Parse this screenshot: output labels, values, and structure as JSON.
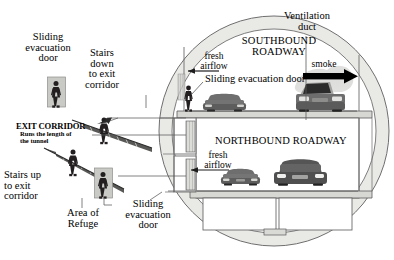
{
  "diagram": {
    "colors": {
      "ring_fill": "#e9e9e6",
      "ring_stroke": "#6f6f6f",
      "roadway_fill": "#ffffff",
      "deck_fill": "#d7d7d4",
      "door_fill": "#c9c9c6",
      "person_fill": "#231f20",
      "car_dark": "#5d5d5d",
      "car_mid": "#6e6e6e",
      "smoke_arrow": "#000000",
      "leader_line": "#5a5a5a"
    }
  },
  "labels": {
    "sliding_evacuation_door_top": "Sliding\nevacuation\ndoor",
    "sliding_evacuation_door_top_l1": "Sliding",
    "sliding_evacuation_door_top_l2": "evacuation",
    "sliding_evacuation_door_top_l3": "door",
    "stairs_down_l1": "Stairs",
    "stairs_down_l2": "down",
    "stairs_down_l3": "to exit",
    "stairs_down_l4": "corridor",
    "exit_corridor_title": "EXIT CORRIDOR",
    "exit_corridor_sub_l1": "Runs the length of",
    "exit_corridor_sub_l2": "the tunnel",
    "stairs_up_l1": "Stairs up",
    "stairs_up_l2": "to exit",
    "stairs_up_l3": "corridor",
    "area_of_refuge_l1": "Area of",
    "area_of_refuge_l2": "Refuge",
    "sliding_evacuation_door_bottom_l1": "Sliding",
    "sliding_evacuation_door_bottom_l2": "evacuation",
    "sliding_evacuation_door_bottom_l3": "door",
    "southbound_l1": "SOUTHBOUND",
    "southbound_l2": "ROADWAY",
    "northbound": "NORTHBOUND ROADWAY",
    "fresh_airflow_top_l1": "fresh",
    "fresh_airflow_top_l2": "airflow",
    "fresh_airflow_bottom_l1": "fresh",
    "fresh_airflow_bottom_l2": "airflow",
    "sliding_evacuation_door_inner": "Sliding evacuation door",
    "smoke": "smoke",
    "ventilation_duct_l1": "Ventilation",
    "ventilation_duct_l2": "duct"
  }
}
